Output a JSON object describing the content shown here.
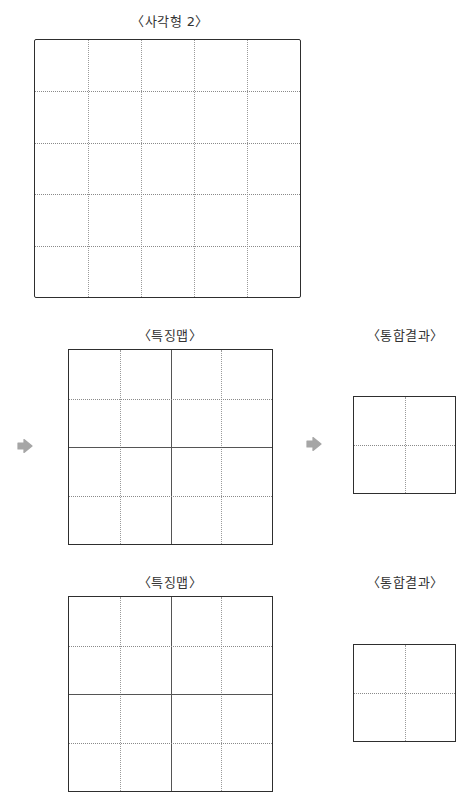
{
  "labels": {
    "input": "〈사각형 2〉",
    "feature_map_1": "〈특징맵〉",
    "pooling_result_1": "〈통합결과〉",
    "feature_map_2": "〈특징맵〉",
    "pooling_result_2": "〈통합결과〉"
  },
  "diagram": {
    "input_grid": {
      "rows": 5,
      "cols": 5,
      "line_style": "dotted"
    },
    "feature_map_grid": {
      "rows": 4,
      "cols": 4,
      "center_lines": "solid",
      "other_lines": "dotted"
    },
    "pooling_grid": {
      "rows": 2,
      "cols": 2,
      "line_style": "dotted"
    }
  },
  "icons": {
    "arrow": "right-arrow-icon",
    "arrow_color": "#a6a6a6"
  },
  "colors": {
    "border": "#2e2e2e",
    "dotted": "#9a9a9a",
    "text": "#333333"
  }
}
